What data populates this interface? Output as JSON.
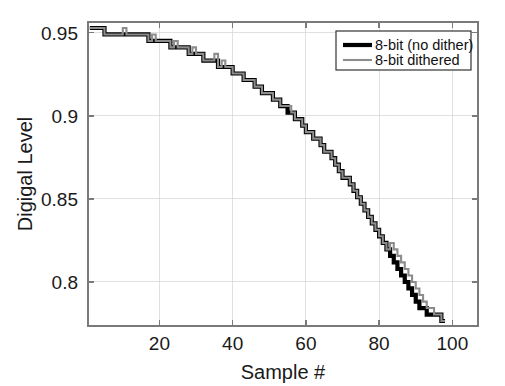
{
  "chart_data": {
    "type": "line",
    "title": "",
    "xlabel": "Sample #",
    "ylabel": "Digigal Level",
    "xlim": [
      0.5,
      107
    ],
    "ylim": [
      0.7735,
      0.9565
    ],
    "grid": true,
    "xticks": [
      20,
      40,
      60,
      80,
      100
    ],
    "xticklabels": [
      "20",
      "40",
      "60",
      "80",
      "100"
    ],
    "yticks": [
      0.95,
      0.9,
      0.85,
      0.8
    ],
    "yticklabels": [
      "0.95",
      "0.9",
      "0.85",
      "0.8"
    ],
    "legend_position": "top-right",
    "quantization_step": 0.00392,
    "series": [
      {
        "name": "8-bit (no dither)",
        "color": "#000000",
        "linewidth": 4.2,
        "x": [
          1,
          2,
          3,
          4,
          5,
          6,
          7,
          8,
          9,
          10,
          11,
          12,
          13,
          14,
          15,
          16,
          17,
          18,
          19,
          20,
          21,
          22,
          23,
          24,
          25,
          26,
          27,
          28,
          29,
          30,
          31,
          32,
          33,
          34,
          35,
          36,
          37,
          38,
          39,
          40,
          41,
          42,
          43,
          44,
          45,
          46,
          47,
          48,
          49,
          50,
          51,
          52,
          53,
          54,
          55,
          56,
          57,
          58,
          59,
          60,
          61,
          62,
          63,
          64,
          65,
          66,
          67,
          68,
          69,
          70,
          71,
          72,
          73,
          74,
          75,
          76,
          77,
          78,
          79,
          80,
          81,
          82,
          83,
          84,
          85,
          86,
          87,
          88,
          89,
          90,
          91,
          92,
          93,
          94,
          95,
          96,
          97,
          98
        ],
        "values": [
          0.9529,
          0.9529,
          0.9529,
          0.9529,
          0.949,
          0.949,
          0.949,
          0.949,
          0.949,
          0.949,
          0.949,
          0.949,
          0.949,
          0.949,
          0.949,
          0.949,
          0.9451,
          0.9451,
          0.9451,
          0.9451,
          0.9451,
          0.9451,
          0.9412,
          0.9412,
          0.9412,
          0.9412,
          0.9412,
          0.9373,
          0.9373,
          0.9373,
          0.9373,
          0.9333,
          0.9333,
          0.9333,
          0.9333,
          0.9294,
          0.9294,
          0.9294,
          0.9294,
          0.9255,
          0.9255,
          0.9255,
          0.9216,
          0.9216,
          0.9216,
          0.9176,
          0.9176,
          0.9137,
          0.9137,
          0.9137,
          0.9098,
          0.9098,
          0.9059,
          0.9059,
          0.902,
          0.902,
          0.898,
          0.898,
          0.8941,
          0.8902,
          0.8902,
          0.8863,
          0.8863,
          0.8824,
          0.8784,
          0.8784,
          0.8745,
          0.8706,
          0.8667,
          0.8627,
          0.8627,
          0.8588,
          0.8549,
          0.851,
          0.8471,
          0.8431,
          0.8392,
          0.8353,
          0.8314,
          0.8275,
          0.8235,
          0.8196,
          0.8157,
          0.8118,
          0.8078,
          0.8039,
          0.8,
          0.7961,
          0.7922,
          0.7882,
          0.7843,
          0.7843,
          0.7804,
          0.7804,
          0.7804,
          0.7804,
          0.7765,
          0.7765
        ]
      },
      {
        "name": "8-bit dithered",
        "color": "#8c8c8c",
        "linewidth": 2.1,
        "x": [
          1,
          2,
          3,
          4,
          5,
          6,
          7,
          8,
          9,
          10,
          11,
          12,
          13,
          14,
          15,
          16,
          17,
          18,
          19,
          20,
          21,
          22,
          23,
          24,
          25,
          26,
          27,
          28,
          29,
          30,
          31,
          32,
          33,
          34,
          35,
          36,
          37,
          38,
          39,
          40,
          41,
          42,
          43,
          44,
          45,
          46,
          47,
          48,
          49,
          50,
          51,
          52,
          53,
          54,
          55,
          56,
          57,
          58,
          59,
          60,
          61,
          62,
          63,
          64,
          65,
          66,
          67,
          68,
          69,
          70,
          71,
          72,
          73,
          74,
          75,
          76,
          77,
          78,
          79,
          80,
          81,
          82,
          83,
          84,
          85,
          86,
          87,
          88,
          89,
          90,
          91,
          92,
          93,
          94,
          95,
          96,
          97,
          98
        ],
        "values": [
          0.9529,
          0.9529,
          0.9529,
          0.9529,
          0.949,
          0.949,
          0.949,
          0.949,
          0.949,
          0.9529,
          0.949,
          0.949,
          0.949,
          0.949,
          0.949,
          0.949,
          0.9451,
          0.949,
          0.9451,
          0.9451,
          0.9451,
          0.9451,
          0.9412,
          0.9451,
          0.9412,
          0.9412,
          0.9412,
          0.9373,
          0.9412,
          0.9373,
          0.9373,
          0.9333,
          0.9333,
          0.9333,
          0.9373,
          0.9294,
          0.9333,
          0.9294,
          0.9294,
          0.9255,
          0.9255,
          0.9255,
          0.9216,
          0.9216,
          0.9216,
          0.9176,
          0.9176,
          0.9137,
          0.9137,
          0.9137,
          0.9098,
          0.9098,
          0.9059,
          0.9059,
          0.9059,
          0.902,
          0.898,
          0.898,
          0.8941,
          0.8902,
          0.8902,
          0.8863,
          0.8863,
          0.8824,
          0.8784,
          0.8784,
          0.8745,
          0.8706,
          0.8667,
          0.8627,
          0.8627,
          0.8588,
          0.8549,
          0.851,
          0.8471,
          0.8431,
          0.8392,
          0.8353,
          0.8314,
          0.8275,
          0.8235,
          0.8196,
          0.8235,
          0.8196,
          0.8157,
          0.8118,
          0.8078,
          0.8039,
          0.8,
          0.7961,
          0.7922,
          0.7882,
          0.7843,
          0.7843,
          0.7804,
          0.7804,
          0.7765,
          0.7765
        ]
      }
    ]
  },
  "legend": {
    "items": [
      {
        "label": "8-bit (no dither)",
        "color": "#000000",
        "width": 4.2
      },
      {
        "label": "8-bit dithered",
        "color": "#8c8c8c",
        "width": 2.1
      }
    ]
  }
}
